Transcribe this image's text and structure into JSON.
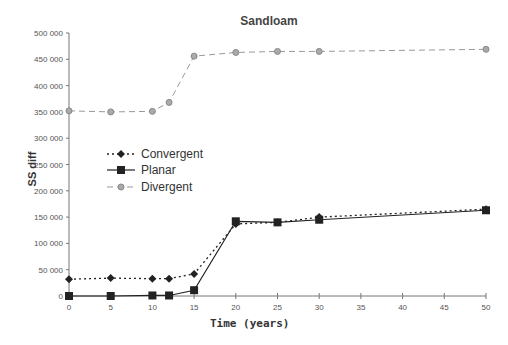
{
  "chart_data": {
    "type": "line",
    "title": "Sandloam",
    "xlabel": "Time (years)",
    "ylabel": "SS diff",
    "x": [
      0,
      5,
      10,
      12,
      15,
      20,
      25,
      30,
      50
    ],
    "xticks": [
      0,
      5,
      10,
      15,
      20,
      25,
      30,
      35,
      40,
      45,
      50
    ],
    "yticks": [
      0,
      50000,
      100000,
      150000,
      200000,
      250000,
      300000,
      350000,
      400000,
      450000,
      500000
    ],
    "ytick_labels": [
      "0",
      "50 000",
      "100 000",
      "150 000",
      "200 000",
      "250 000",
      "300 000",
      "350 000",
      "400 000",
      "450 000",
      "500 000"
    ],
    "xlim": [
      0,
      50
    ],
    "ylim": [
      0,
      500000
    ],
    "grid": false,
    "legend_position": "inside-left",
    "series": [
      {
        "name": "Convergent",
        "style": "dotted",
        "marker": "diamond",
        "color": "#222222",
        "values": [
          32000,
          34000,
          33000,
          33000,
          42000,
          137000,
          140000,
          150000,
          165000
        ]
      },
      {
        "name": "Planar",
        "style": "solid",
        "marker": "square",
        "color": "#222222",
        "values": [
          0,
          0,
          1000,
          1000,
          11000,
          142000,
          140000,
          145000,
          163000
        ]
      },
      {
        "name": "Divergent",
        "style": "dashed",
        "marker": "circle",
        "color": "#999999",
        "values": [
          352000,
          350000,
          351000,
          368000,
          456000,
          463000,
          465000,
          465000,
          469000
        ]
      }
    ]
  }
}
